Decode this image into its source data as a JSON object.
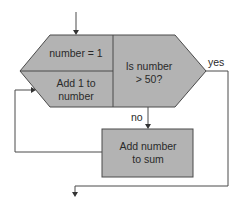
{
  "diagram": {
    "type": "flowchart",
    "colors": {
      "shape_fill": "#b3b3b3",
      "stroke": "#4a4a4a",
      "text": "#2a2a2a",
      "background": "#ffffff"
    },
    "nodes": {
      "init": {
        "label": "number = 1"
      },
      "increment": {
        "line1": "Add 1 to",
        "line2": "number"
      },
      "decision": {
        "line1": "Is number",
        "line2": "> 50?"
      },
      "process": {
        "line1": "Add number",
        "line2": "to sum"
      }
    },
    "edges": {
      "yes_label": "yes",
      "no_label": "no"
    }
  }
}
